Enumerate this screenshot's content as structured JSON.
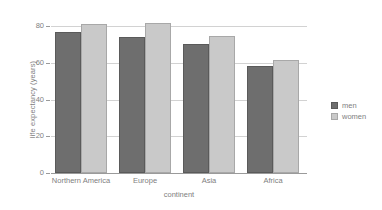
{
  "chart_data": {
    "type": "bar",
    "title": "",
    "xlabel": "continent",
    "ylabel": "life expectancy (years)",
    "categories": [
      "Northern America",
      "Europe",
      "Asia",
      "Africa"
    ],
    "series": [
      {
        "name": "men",
        "values": [
          77,
          74,
          70.5,
          58.5
        ],
        "color": "#6e6e6e"
      },
      {
        "name": "women",
        "values": [
          81,
          81.5,
          74.5,
          61.5
        ],
        "color": "#c9c9c9"
      }
    ],
    "ylim": [
      0,
      85
    ],
    "yticks": [
      0,
      20,
      40,
      60,
      80
    ],
    "ytick_labels": [
      "0",
      "20",
      "40",
      "60",
      "80"
    ],
    "grid": true,
    "grid_axis": "y",
    "legend_position": "right",
    "background": "#ffffff",
    "text_color": "#808080",
    "grid_color": "#d2d2d2"
  },
  "legend": {
    "entries": [
      {
        "label": "men"
      },
      {
        "label": "women"
      }
    ]
  }
}
